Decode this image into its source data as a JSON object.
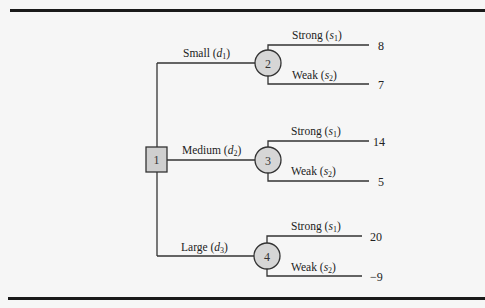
{
  "diagram": {
    "type": "decision-tree",
    "decision_node": {
      "id": "1",
      "label": "1"
    },
    "decisions": [
      {
        "label": "Small",
        "var": "d",
        "sub": "1",
        "chance_node": "2",
        "outcomes": [
          {
            "label": "Strong",
            "var": "s",
            "sub": "1",
            "payoff": "8"
          },
          {
            "label": "Weak",
            "var": "s",
            "sub": "2",
            "payoff": "7"
          }
        ]
      },
      {
        "label": "Medium",
        "var": "d",
        "sub": "2",
        "chance_node": "3",
        "outcomes": [
          {
            "label": "Strong",
            "var": "s",
            "sub": "1",
            "payoff": "14"
          },
          {
            "label": "Weak",
            "var": "s",
            "sub": "2",
            "payoff": "5"
          }
        ]
      },
      {
        "label": "Large",
        "var": "d",
        "sub": "3",
        "chance_node": "4",
        "outcomes": [
          {
            "label": "Strong",
            "var": "s",
            "sub": "1",
            "payoff": "20"
          },
          {
            "label": "Weak",
            "var": "s",
            "sub": "2",
            "payoff": "−9"
          }
        ]
      }
    ]
  }
}
